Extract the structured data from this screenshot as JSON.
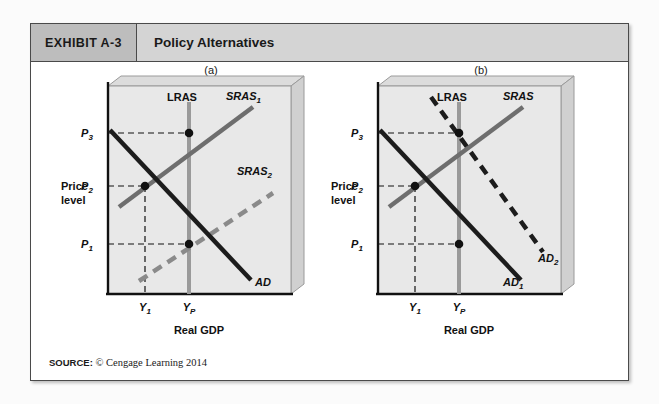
{
  "exhibit": {
    "number": "EXHIBIT A-3",
    "title": "Policy Alternatives",
    "source_label": "SOURCE:",
    "source_text": "© Cengage Learning 2014"
  },
  "colors": {
    "header_band": "#d4d4d4",
    "header_number_band": "#bdbdbd",
    "plot_fill": "#e8e8e8",
    "box_side": "#d0d0d0",
    "lras_line": "#9a9a9a",
    "sras_line": "#6e6e6e",
    "ad_line": "#1c1c1c",
    "frame": "#4a4a4a"
  },
  "panels": [
    {
      "caption": "(a)",
      "y_axis_label_line1": "Price",
      "y_axis_label_line2": "level",
      "x_axis_label": "Real GDP",
      "price_ticks": [
        "P3",
        "P2",
        "P1"
      ],
      "price_tick_text": [
        "P",
        "P",
        "P"
      ],
      "price_tick_subs": [
        "3",
        "2",
        "1"
      ],
      "output_ticks": [
        "Y1",
        "YP"
      ],
      "output_tick_text": [
        "Y",
        "Y"
      ],
      "output_tick_subs": [
        "1",
        "P"
      ],
      "curves": [
        {
          "name": "lras",
          "label": "LRAS",
          "sub": "",
          "style": "solid",
          "color": "#9a9a9a"
        },
        {
          "name": "sras1",
          "label": "SRAS",
          "sub": "1",
          "style": "solid",
          "color": "#6e6e6e"
        },
        {
          "name": "sras2",
          "label": "SRAS",
          "sub": "2",
          "style": "dashed",
          "color": "#8a8a8a"
        },
        {
          "name": "ad",
          "label": "AD",
          "sub": "",
          "style": "solid",
          "color": "#1c1c1c"
        }
      ],
      "equilibria": [
        {
          "name": "initial",
          "price": "P2",
          "output": "Y1"
        },
        {
          "name": "upper",
          "price": "P3",
          "output": "YP"
        },
        {
          "name": "lower",
          "price": "P1",
          "output": "YP"
        }
      ]
    },
    {
      "caption": "(b)",
      "y_axis_label_line1": "Price",
      "y_axis_label_line2": "level",
      "x_axis_label": "Real GDP",
      "price_ticks": [
        "P3",
        "P2",
        "P1"
      ],
      "price_tick_text": [
        "P",
        "P",
        "P"
      ],
      "price_tick_subs": [
        "3",
        "2",
        "1"
      ],
      "output_ticks": [
        "Y1",
        "YP"
      ],
      "output_tick_text": [
        "Y",
        "Y"
      ],
      "output_tick_subs": [
        "1",
        "P"
      ],
      "curves": [
        {
          "name": "lras",
          "label": "LRAS",
          "sub": "",
          "style": "solid",
          "color": "#9a9a9a"
        },
        {
          "name": "sras",
          "label": "SRAS",
          "sub": "",
          "style": "solid",
          "color": "#6e6e6e"
        },
        {
          "name": "ad1",
          "label": "AD",
          "sub": "1",
          "style": "solid",
          "color": "#1c1c1c"
        },
        {
          "name": "ad2",
          "label": "AD",
          "sub": "2",
          "style": "dashed",
          "color": "#1c1c1c"
        }
      ],
      "equilibria": [
        {
          "name": "initial",
          "price": "P2",
          "output": "Y1"
        },
        {
          "name": "upper",
          "price": "P3",
          "output": "YP"
        },
        {
          "name": "lower",
          "price": "P1",
          "output": "YP"
        }
      ]
    }
  ]
}
